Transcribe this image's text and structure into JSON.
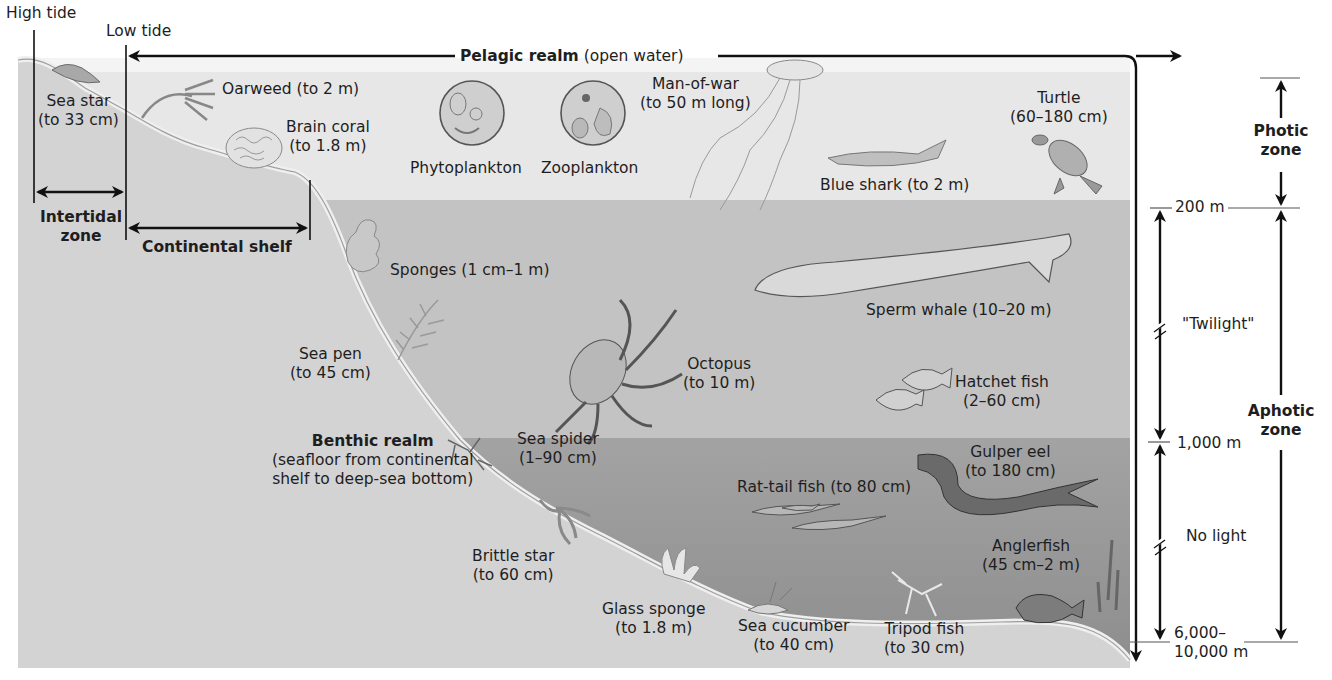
{
  "diagram": {
    "tide_markers": {
      "high": "High tide",
      "low": "Low tide"
    },
    "realms": {
      "pelagic": {
        "name": "Pelagic realm",
        "desc": "(open water)"
      },
      "benthic": {
        "name": "Benthic realm",
        "desc_line1": "(seafloor from continental",
        "desc_line2": "shelf to deep-sea bottom)"
      }
    },
    "zones": {
      "intertidal": {
        "line1": "Intertidal",
        "line2": "zone"
      },
      "continental_shelf": "Continental shelf",
      "photic": {
        "line1": "Photic",
        "line2": "zone"
      },
      "aphotic": {
        "line1": "Aphotic",
        "line2": "zone"
      }
    },
    "depth_scale": {
      "d200": "200 m",
      "d1000": "1,000 m",
      "d_bottom_line1": "6,000–",
      "d_bottom_line2": "10,000 m",
      "twilight": "\"Twilight\"",
      "no_light": "No light"
    },
    "colors": {
      "sky": "#ffffff",
      "photic_water": "#e6e6e6",
      "twilight_water": "#c4c4c4",
      "deep_water": "#9a9a9a",
      "seafloor": "#d2d2d2",
      "seafloor_edge": "#ececec",
      "ink": "#111111"
    },
    "organisms": [
      {
        "id": "sea-star",
        "name": "Sea star",
        "size": "(to 33 cm)"
      },
      {
        "id": "oarweed",
        "name": "Oarweed (to 2 m)"
      },
      {
        "id": "brain-coral",
        "name": "Brain coral",
        "size": "(to 1.8 m)"
      },
      {
        "id": "phytoplankton",
        "name": "Phytoplankton"
      },
      {
        "id": "zooplankton",
        "name": "Zooplankton"
      },
      {
        "id": "man-of-war",
        "name": "Man-of-war",
        "size": "(to 50 m long)"
      },
      {
        "id": "turtle",
        "name": "Turtle",
        "size": "(60–180 cm)"
      },
      {
        "id": "blue-shark",
        "name": "Blue shark (to 2 m)"
      },
      {
        "id": "sponges",
        "name": "Sponges (1 cm–1 m)"
      },
      {
        "id": "sperm-whale",
        "name": "Sperm whale (10–20 m)"
      },
      {
        "id": "sea-pen",
        "name": "Sea pen",
        "size": "(to 45 cm)"
      },
      {
        "id": "octopus",
        "name": "Octopus",
        "size": "(to 10 m)"
      },
      {
        "id": "hatchet-fish",
        "name": "Hatchet fish",
        "size": "(2–60 cm)"
      },
      {
        "id": "sea-spider",
        "name": "Sea spider",
        "size": "(1–90 cm)"
      },
      {
        "id": "gulper-eel",
        "name": "Gulper eel",
        "size": "(to 180 cm)"
      },
      {
        "id": "rat-tail-fish",
        "name": "Rat-tail fish (to 80 cm)"
      },
      {
        "id": "brittle-star",
        "name": "Brittle star",
        "size": "(to 60 cm)"
      },
      {
        "id": "anglerfish",
        "name": "Anglerfish",
        "size": "(45 cm–2 m)"
      },
      {
        "id": "glass-sponge",
        "name": "Glass sponge",
        "size": "(to 1.8 m)"
      },
      {
        "id": "sea-cucumber",
        "name": "Sea cucumber",
        "size": "(to 40 cm)"
      },
      {
        "id": "tripod-fish",
        "name": "Tripod fish",
        "size": "(to 30 cm)"
      }
    ]
  }
}
